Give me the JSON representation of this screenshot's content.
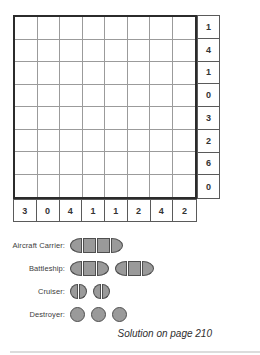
{
  "puzzle": {
    "grid": {
      "rows": 8,
      "cols": 8
    },
    "row_clues": [
      1,
      4,
      1,
      0,
      3,
      2,
      6,
      0
    ],
    "col_clues": [
      3,
      0,
      4,
      1,
      1,
      2,
      4,
      2
    ]
  },
  "fleet": [
    {
      "label": "Aircraft Carrier:",
      "ships": [
        4
      ]
    },
    {
      "label": "Battleship:",
      "ships": [
        3,
        3
      ]
    },
    {
      "label": "Cruiser:",
      "ships": [
        2,
        2
      ]
    },
    {
      "label": "Destroyer:",
      "ships": [
        1,
        1,
        1
      ]
    }
  ],
  "footer": {
    "solution_note": "Solution on page 210"
  },
  "colors": {
    "ship_fill": "#9a9a9a",
    "ship_stroke": "#4f4f4f",
    "grid_line": "#9b9b9b",
    "grid_border": "#2b2b2b",
    "clue_text": "#333333"
  }
}
